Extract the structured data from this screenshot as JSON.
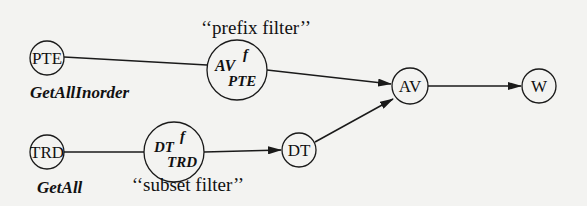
{
  "diagram": {
    "colors": {
      "stroke": "#1a1a1a",
      "background": "#f3f3f1",
      "text": "#111111"
    },
    "nodes": {
      "pte": {
        "label": "PTE",
        "cx": 47,
        "cy": 58,
        "r": 17,
        "caption": "GetAllInorder"
      },
      "av_f_pte": {
        "base": "AV",
        "sup": "f",
        "sub": "PTE",
        "cx": 237,
        "cy": 70,
        "r": 30,
        "annotation": "‘‘prefix filter’’"
      },
      "av": {
        "label": "AV",
        "cx": 410,
        "cy": 86,
        "r": 18
      },
      "w": {
        "label": "W",
        "cx": 539,
        "cy": 86,
        "r": 17
      },
      "trd": {
        "label": "TRD",
        "cx": 47,
        "cy": 152,
        "r": 17,
        "caption": "GetAll"
      },
      "dt_f_trd": {
        "base": "DT",
        "sup": "f",
        "sub": "TRD",
        "cx": 174,
        "cy": 152,
        "r": 30,
        "annotation": "‘‘subset filter’’"
      },
      "dt": {
        "label": "DT",
        "cx": 299,
        "cy": 150,
        "r": 17
      }
    },
    "edges": [
      {
        "from": "PTE",
        "to": "AV^f_PTE",
        "arrow": false
      },
      {
        "from": "AV^f_PTE",
        "to": "AV",
        "arrow": true
      },
      {
        "from": "AV",
        "to": "W",
        "arrow": true
      },
      {
        "from": "TRD",
        "to": "DT^f_TRD",
        "arrow": false
      },
      {
        "from": "DT^f_TRD",
        "to": "DT",
        "arrow": true
      },
      {
        "from": "DT",
        "to": "AV",
        "arrow": true
      }
    ]
  }
}
